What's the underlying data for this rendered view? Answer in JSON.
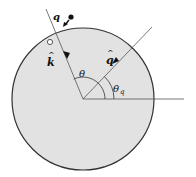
{
  "diagram": {
    "colors": {
      "disk_fill": "#e2e2e2",
      "disk_stroke": "#333333",
      "line": "#555555",
      "ink": "#111111"
    },
    "labels": {
      "charge": "q",
      "k_vector": "k",
      "k_hat": "^",
      "q_vector": "q",
      "q_hat": "^",
      "theta": "θ",
      "theta_q": "θ",
      "theta_q_sub": "q"
    },
    "angles_deg": {
      "k_direction": 115,
      "q_direction": 40
    },
    "markers": {
      "filled_dot": "incoming charge position",
      "open_dot": "image / surface point"
    }
  }
}
